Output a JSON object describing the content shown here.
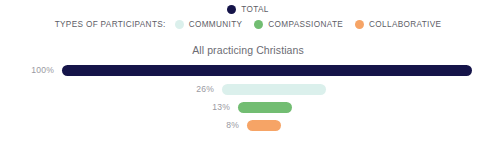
{
  "legend": {
    "total": {
      "label": "TOTAL",
      "color": "#151449",
      "swatch_name": "legend-swatch-total"
    },
    "prefix": "TYPES OF PARTICIPANTS:",
    "items": [
      {
        "label": "COMMUNITY",
        "color": "#dbf0ec"
      },
      {
        "label": "COMPASSIONATE",
        "color": "#72bd72"
      },
      {
        "label": "COLLABORATIVE",
        "color": "#f6a466"
      }
    ]
  },
  "chart_data": {
    "type": "bar",
    "title": "All practicing Christians",
    "xlabel": "",
    "ylabel": "",
    "orientation": "horizontal",
    "grid": false,
    "legend_position": "top",
    "xlim": [
      0,
      100
    ],
    "value_suffix": "%",
    "categories": [
      "TOTAL",
      "COMMUNITY",
      "COMPASSIONATE",
      "COLLABORATIVE"
    ],
    "values": [
      100,
      26,
      13,
      8
    ],
    "colors": [
      "#151449",
      "#dbf0ec",
      "#72bd72",
      "#f6a466"
    ],
    "bars": [
      {
        "category": "TOTAL",
        "value": 100,
        "label": "100%",
        "color": "#151449"
      },
      {
        "category": "COMMUNITY",
        "value": 26,
        "label": "26%",
        "color": "#dbf0ec"
      },
      {
        "category": "COMPASSIONATE",
        "value": 13,
        "label": "13%",
        "color": "#72bd72"
      },
      {
        "category": "COLLABORATIVE",
        "value": 8,
        "label": "8%",
        "color": "#f6a466"
      }
    ]
  },
  "geometry": {
    "rows": [
      {
        "top": 0,
        "bar_left": 62,
        "bar_width": 410,
        "label_right": 440
      },
      {
        "top": 19,
        "bar_left": 222,
        "bar_width": 104,
        "label_right": 280
      },
      {
        "top": 37,
        "bar_left": 238,
        "bar_width": 54,
        "label_right": 264
      },
      {
        "top": 55,
        "bar_left": 247,
        "bar_width": 34,
        "label_right": 255
      }
    ]
  }
}
